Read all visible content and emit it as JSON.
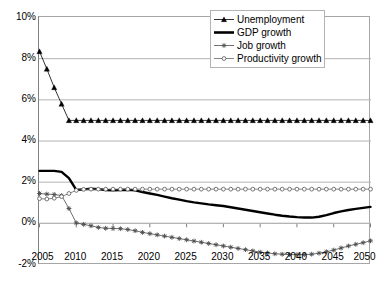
{
  "chart_data": {
    "type": "line",
    "title": "",
    "xlabel": "",
    "ylabel": "",
    "grid": true,
    "legend_position": "top-right",
    "xlim": [
      2005,
      2050
    ],
    "ylim": [
      -2,
      10
    ],
    "y_tick_labels": [
      "10%",
      "8%",
      "6%",
      "4%",
      "2%",
      "0%",
      "-2%"
    ],
    "y_ticks": [
      10,
      8,
      6,
      4,
      2,
      0,
      -2
    ],
    "x_tick_labels": [
      "2005",
      "2010",
      "2015",
      "2020",
      "2025",
      "2030",
      "2035",
      "2040",
      "2045",
      "2050"
    ],
    "x_ticks": [
      2005,
      2010,
      2015,
      2020,
      2025,
      2030,
      2035,
      2040,
      2045,
      2050
    ],
    "x": [
      2005,
      2006,
      2007,
      2008,
      2009,
      2010,
      2011,
      2012,
      2013,
      2014,
      2015,
      2016,
      2017,
      2018,
      2019,
      2020,
      2021,
      2022,
      2023,
      2024,
      2025,
      2026,
      2027,
      2028,
      2029,
      2030,
      2031,
      2032,
      2033,
      2034,
      2035,
      2036,
      2037,
      2038,
      2039,
      2040,
      2041,
      2042,
      2043,
      2044,
      2045,
      2046,
      2047,
      2048,
      2049,
      2050
    ],
    "series": [
      {
        "name": "Unemployment",
        "marker": "triangle",
        "color": "#000000",
        "line_width": 0.8,
        "values": [
          8.35,
          7.5,
          6.6,
          5.8,
          5.0,
          5.0,
          5.0,
          5.0,
          5.0,
          5.0,
          5.0,
          5.0,
          5.0,
          5.0,
          5.0,
          5.0,
          5.0,
          5.0,
          5.0,
          5.0,
          5.0,
          5.0,
          5.0,
          5.0,
          5.0,
          5.0,
          5.0,
          5.0,
          5.0,
          5.0,
          5.0,
          5.0,
          5.0,
          5.0,
          5.0,
          5.0,
          5.0,
          5.0,
          5.0,
          5.0,
          5.0,
          5.0,
          5.0,
          5.0,
          5.0,
          5.0
        ]
      },
      {
        "name": "GDP growth",
        "marker": "none",
        "color": "#000000",
        "line_width": 2.4,
        "values": [
          2.55,
          2.55,
          2.55,
          2.5,
          2.2,
          1.62,
          1.65,
          1.68,
          1.66,
          1.62,
          1.6,
          1.62,
          1.63,
          1.6,
          1.52,
          1.45,
          1.38,
          1.3,
          1.22,
          1.15,
          1.08,
          1.02,
          0.97,
          0.92,
          0.88,
          0.84,
          0.78,
          0.72,
          0.66,
          0.6,
          0.54,
          0.48,
          0.42,
          0.37,
          0.33,
          0.3,
          0.28,
          0.28,
          0.32,
          0.4,
          0.5,
          0.58,
          0.65,
          0.7,
          0.75,
          0.8
        ]
      },
      {
        "name": "Job growth",
        "marker": "asterisk",
        "color": "#4d4d4d",
        "line_width": 0.8,
        "values": [
          1.45,
          1.42,
          1.4,
          1.35,
          0.72,
          0.02,
          -0.05,
          -0.12,
          -0.2,
          -0.24,
          -0.25,
          -0.26,
          -0.3,
          -0.36,
          -0.44,
          -0.5,
          -0.56,
          -0.62,
          -0.68,
          -0.74,
          -0.8,
          -0.86,
          -0.92,
          -0.98,
          -1.04,
          -1.1,
          -1.16,
          -1.22,
          -1.28,
          -1.34,
          -1.4,
          -1.44,
          -1.48,
          -1.5,
          -1.52,
          -1.52,
          -1.52,
          -1.5,
          -1.45,
          -1.38,
          -1.3,
          -1.2,
          -1.1,
          -1.02,
          -0.94,
          -0.85
        ]
      },
      {
        "name": "Productivity growth",
        "marker": "circle",
        "color": "#666666",
        "line_width": 0.8,
        "values": [
          1.2,
          1.18,
          1.22,
          1.3,
          1.45,
          1.6,
          1.65,
          1.66,
          1.66,
          1.66,
          1.66,
          1.66,
          1.66,
          1.66,
          1.66,
          1.66,
          1.66,
          1.66,
          1.66,
          1.66,
          1.66,
          1.66,
          1.66,
          1.66,
          1.66,
          1.66,
          1.66,
          1.66,
          1.66,
          1.66,
          1.66,
          1.66,
          1.66,
          1.66,
          1.66,
          1.66,
          1.66,
          1.66,
          1.66,
          1.66,
          1.66,
          1.66,
          1.66,
          1.66,
          1.66,
          1.66
        ]
      }
    ]
  },
  "legend": {
    "items": [
      {
        "label": "Unemployment",
        "marker": "triangle"
      },
      {
        "label": "GDP growth",
        "marker": "none"
      },
      {
        "label": "Job growth",
        "marker": "asterisk"
      },
      {
        "label": "Productivity growth",
        "marker": "circle"
      }
    ]
  },
  "colors": {
    "axis": "#808080",
    "grid": "#b3b3b3",
    "frame": "#a6a6a6",
    "series_primary": "#000000"
  }
}
